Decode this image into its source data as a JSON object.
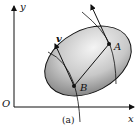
{
  "figure": {
    "caption": "(a)",
    "axes": {
      "x_label": "x",
      "y_label": "y",
      "origin_label": "O"
    },
    "points": [
      {
        "label": "A"
      },
      {
        "label": "B"
      }
    ],
    "vector_label": "v",
    "colors": {
      "ink": "#111111",
      "fill_light": "#f2f2f2",
      "fill_dark": "#8a8a8a"
    }
  }
}
